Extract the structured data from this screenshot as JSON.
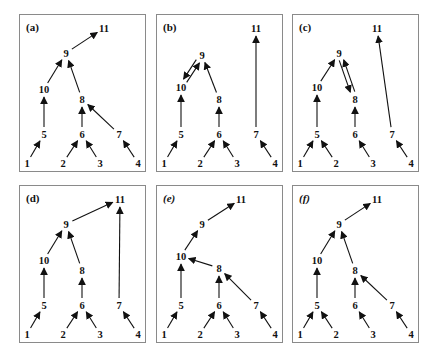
{
  "figure": {
    "nodes": {
      "1": [
        7,
        148
      ],
      "2": [
        43,
        148
      ],
      "3": [
        80,
        148
      ],
      "4": [
        118,
        148
      ],
      "5": [
        24,
        119
      ],
      "6": [
        62,
        119
      ],
      "7": [
        99,
        119
      ],
      "10": [
        24,
        74
      ],
      "8": [
        62,
        84
      ],
      "9": [
        46,
        38
      ],
      "11": [
        84,
        13
      ]
    },
    "panels": [
      {
        "id": "a",
        "label": "(a)",
        "x": 19,
        "y": 14,
        "nodes": {},
        "edges": [
          [
            "1",
            "5"
          ],
          [
            "5",
            "10"
          ],
          [
            "10",
            "9"
          ],
          [
            "9",
            "11"
          ],
          [
            "2",
            "6"
          ],
          [
            "3",
            "6"
          ],
          [
            "6",
            "8"
          ],
          [
            "7",
            "8"
          ],
          [
            "8",
            "9"
          ],
          [
            "4",
            "7"
          ]
        ]
      },
      {
        "id": "b",
        "label": "(b)",
        "x": 156,
        "y": 14,
        "nodes": {
          "9": [
            45,
            40
          ],
          "10": [
            24,
            72
          ],
          "8": [
            62,
            84
          ],
          "11": [
            99,
            13
          ]
        },
        "edges": [
          [
            "1",
            "5"
          ],
          [
            "5",
            "10"
          ],
          [
            "10",
            "9"
          ],
          [
            "9",
            "10"
          ],
          [
            "2",
            "6"
          ],
          [
            "3",
            "6"
          ],
          [
            "6",
            "8"
          ],
          [
            "8",
            "9"
          ],
          [
            "7",
            "11"
          ],
          [
            "4",
            "7"
          ]
        ],
        "parallel": [
          [
            "10",
            "9"
          ],
          [
            "9",
            "10"
          ]
        ]
      },
      {
        "id": "c",
        "label": "(c)",
        "x": 292,
        "y": 14,
        "nodes": {
          "1": [
            7,
            148
          ],
          "2": [
            43,
            148
          ],
          "3": [
            80,
            148
          ],
          "4": [
            118,
            148
          ],
          "5": [
            24,
            119
          ],
          "6": [
            62,
            119
          ],
          "7": [
            99,
            119
          ],
          "10": [
            24,
            72
          ],
          "9": [
            46,
            38
          ],
          "8": [
            62,
            84
          ],
          "11": [
            84,
            13
          ]
        },
        "edges": [
          [
            "1",
            "5"
          ],
          [
            "2",
            "5"
          ],
          [
            "5",
            "10"
          ],
          [
            "10",
            "9"
          ],
          [
            "9",
            "8"
          ],
          [
            "8",
            "9"
          ],
          [
            "3",
            "6"
          ],
          [
            "6",
            "8"
          ],
          [
            "7",
            "11"
          ],
          [
            "4",
            "7"
          ]
        ],
        "parallel": [
          [
            "9",
            "8"
          ],
          [
            "8",
            "9"
          ]
        ]
      },
      {
        "id": "d",
        "label": "(d)",
        "x": 19,
        "y": 185,
        "nodes": {
          "11": [
            100,
            13
          ]
        },
        "edges": [
          [
            "1",
            "5"
          ],
          [
            "5",
            "10"
          ],
          [
            "10",
            "9"
          ],
          [
            "9",
            "11"
          ],
          [
            "2",
            "6"
          ],
          [
            "3",
            "6"
          ],
          [
            "6",
            "8"
          ],
          [
            "8",
            "9"
          ],
          [
            "7",
            "11"
          ],
          [
            "4",
            "7"
          ]
        ]
      },
      {
        "id": "e",
        "label": "(e)",
        "x": 156,
        "y": 185,
        "nodes": {
          "9": [
            45,
            38
          ],
          "10": [
            24,
            70
          ],
          "8": [
            62,
            82
          ]
        },
        "edges": [
          [
            "1",
            "5"
          ],
          [
            "5",
            "10"
          ],
          [
            "10",
            "9"
          ],
          [
            "9",
            "11"
          ],
          [
            "2",
            "6"
          ],
          [
            "3",
            "6"
          ],
          [
            "6",
            "8"
          ],
          [
            "8",
            "10"
          ],
          [
            "7",
            "8"
          ],
          [
            "4",
            "7"
          ]
        ]
      },
      {
        "id": "f",
        "label": "(f)",
        "x": 292,
        "y": 185,
        "nodes": {},
        "edges": [
          [
            "1",
            "5"
          ],
          [
            "2",
            "5"
          ],
          [
            "5",
            "10"
          ],
          [
            "10",
            "9"
          ],
          [
            "9",
            "11"
          ],
          [
            "3",
            "6"
          ],
          [
            "6",
            "8"
          ],
          [
            "7",
            "8"
          ],
          [
            "8",
            "9"
          ],
          [
            "4",
            "7"
          ]
        ]
      }
    ]
  },
  "layout": {
    "panel_width": 127,
    "panel_height": 158
  }
}
